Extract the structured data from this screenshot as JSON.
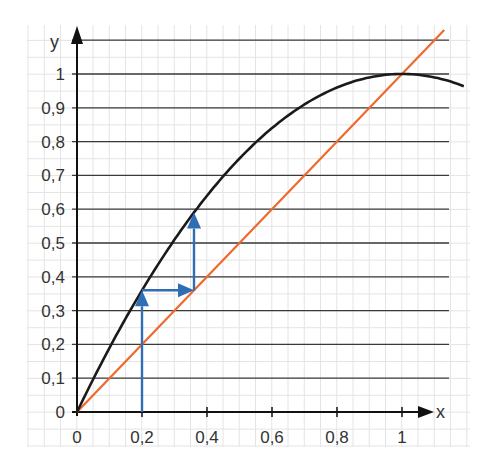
{
  "chart_data": {
    "type": "line",
    "title": "",
    "xlabel": "x",
    "ylabel": "y",
    "xlim": [
      0,
      1.2
    ],
    "ylim": [
      0,
      1.1
    ],
    "grid": true,
    "x_ticks": [
      "0",
      "0,2",
      "0,4",
      "0,6",
      "0,8",
      "1"
    ],
    "y_ticks": [
      "0",
      "0,1",
      "0,2",
      "0,3",
      "0,4",
      "0,5",
      "0,6",
      "0,7",
      "0,8",
      "0,9",
      "1"
    ],
    "series": [
      {
        "name": "curve y = x(2 - x)",
        "color": "#1a1a1a",
        "x": [
          0,
          0.2,
          0.4,
          0.6,
          0.8,
          1.0,
          1.2
        ],
        "y": [
          0,
          0.36,
          0.64,
          0.84,
          0.96,
          1.0,
          0.96
        ]
      },
      {
        "name": "line y = x",
        "color": "#ee6a2c",
        "x": [
          0,
          1.13
        ],
        "y": [
          0,
          1.13
        ]
      }
    ],
    "annotations": [
      {
        "type": "arrow",
        "color": "#2f6db5",
        "from": [
          0.2,
          0
        ],
        "to": [
          0.2,
          0.36
        ]
      },
      {
        "type": "arrow",
        "color": "#2f6db5",
        "from": [
          0.2,
          0.36
        ],
        "to": [
          0.36,
          0.36
        ]
      },
      {
        "type": "arrow",
        "color": "#2f6db5",
        "from": [
          0.36,
          0.36
        ],
        "to": [
          0.36,
          0.59
        ]
      }
    ]
  },
  "axes": {
    "x_label": "x",
    "y_label": "y"
  },
  "colors": {
    "curve": "#1a1a1a",
    "line": "#ee6a2c",
    "arrows": "#2f6db5",
    "grid": "#e4e4e4",
    "hlines": "#3a3a3a"
  }
}
